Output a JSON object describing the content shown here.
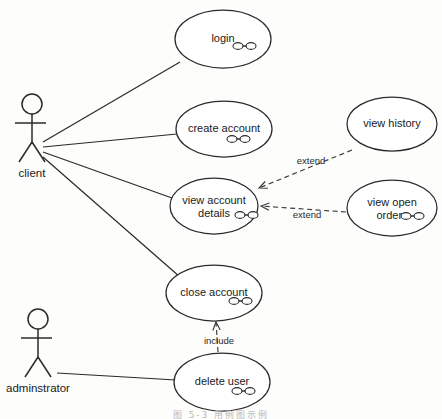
{
  "diagram": {
    "kind": "uml-use-case-diagram",
    "caption": "图 5-3  用例图示例",
    "colors": {
      "background": "#fdfdfc",
      "stroke": "#2a2a2a",
      "dashed_stroke": "#3a3a3a",
      "text": "#1a1a1a",
      "ellipse_fill": "#ffffff"
    }
  },
  "actors": [
    {
      "id": "client",
      "label": "client",
      "cx": 32,
      "cy": 130
    },
    {
      "id": "administrator",
      "label": "adminstrator",
      "cx": 38,
      "cy": 345
    }
  ],
  "use_cases": [
    {
      "id": "login",
      "label_line1": "login",
      "label_line2": "",
      "cx": 223,
      "cy": 39,
      "rx": 48,
      "ry": 29
    },
    {
      "id": "create_account",
      "label_line1": "create account",
      "label_line2": "",
      "cx": 224,
      "cy": 129,
      "rx": 48,
      "ry": 28
    },
    {
      "id": "view_account",
      "label_line1": "view account",
      "label_line2": "details",
      "cx": 214,
      "cy": 206,
      "rx": 44,
      "ry": 28
    },
    {
      "id": "close_account",
      "label_line1": "close account",
      "label_line2": "",
      "cx": 214,
      "cy": 293,
      "rx": 48,
      "ry": 28
    },
    {
      "id": "delete_user",
      "label_line1": "delete user",
      "label_line2": "",
      "cx": 222,
      "cy": 382,
      "rx": 48,
      "ry": 29
    },
    {
      "id": "view_history",
      "label_line1": "view history",
      "label_line2": "",
      "cx": 392,
      "cy": 124,
      "rx": 45,
      "ry": 27
    },
    {
      "id": "view_open",
      "label_line1": "view open",
      "label_line2": "orders",
      "cx": 392,
      "cy": 208,
      "rx": 45,
      "ry": 28
    }
  ],
  "associations": [
    {
      "id": "client-login",
      "from": "client",
      "to": "login",
      "x1": 43,
      "y1": 142,
      "x2": 180,
      "y2": 62
    },
    {
      "id": "client-create",
      "from": "client",
      "to": "create_account",
      "x1": 43,
      "y1": 147,
      "x2": 177,
      "y2": 134
    },
    {
      "id": "client-view-account",
      "from": "client",
      "to": "view_account",
      "x1": 43,
      "y1": 152,
      "x2": 172,
      "y2": 198
    },
    {
      "id": "client-close-account",
      "from": "client",
      "to": "close_account",
      "x1": 43,
      "y1": 157,
      "x2": 180,
      "y2": 277
    },
    {
      "id": "admin-delete-user",
      "from": "administrator",
      "to": "delete_user",
      "x1": 57,
      "y1": 373,
      "x2": 176,
      "y2": 380
    }
  ],
  "dependencies": [
    {
      "id": "extend-view-history",
      "label": "extend",
      "from": "view_history",
      "to": "view_account",
      "x1": 352,
      "y1": 150,
      "x2": 259,
      "y2": 188,
      "label_x": 311,
      "label_y": 164
    },
    {
      "id": "extend-view-open-orders",
      "label": "extend",
      "from": "view_open",
      "to": "view_account",
      "x1": 346,
      "y1": 212,
      "x2": 261,
      "y2": 206,
      "label_x": 307,
      "label_y": 218
    },
    {
      "id": "include-delete-user",
      "label": "include",
      "from": "delete_user",
      "to": "close_account",
      "x1": 218,
      "y1": 352,
      "x2": 216,
      "y2": 322,
      "label_x": 219,
      "label_y": 344
    }
  ],
  "markers": [
    {
      "id": "marker-login",
      "owner": "login",
      "x": 238,
      "y": 46
    },
    {
      "id": "marker-create-account",
      "owner": "create_account",
      "x": 232,
      "y": 139
    },
    {
      "id": "marker-view-account",
      "owner": "view_account",
      "x": 240,
      "y": 215
    },
    {
      "id": "marker-close-account",
      "owner": "close_account",
      "x": 234,
      "y": 301
    },
    {
      "id": "marker-delete-user",
      "owner": "delete_user",
      "x": 237,
      "y": 391
    },
    {
      "id": "marker-view-open",
      "owner": "view_open",
      "x": 406,
      "y": 216
    }
  ]
}
